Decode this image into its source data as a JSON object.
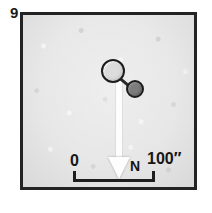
{
  "figure": {
    "panel_number": "9",
    "type": "astronomical-finder-chart",
    "frame": {
      "border_color": "#232323",
      "background_color": "#e7e7e7"
    },
    "sources": [
      {
        "id": "primary",
        "name": "primary-source",
        "shape": "circle",
        "fill": "#dcdcdc",
        "outline": "#1d1d1d",
        "relative_size": "large"
      },
      {
        "id": "secondary",
        "name": "secondary-source",
        "shape": "circle",
        "fill": "#7d7d7d",
        "outline": "#1d1d1d",
        "relative_size": "small"
      }
    ],
    "north_arrow": {
      "label": "N",
      "direction": "down",
      "color": "#fdfdfd"
    },
    "scale_bar": {
      "start_label": "0",
      "end_label": "100″",
      "color": "#1e1e1e"
    }
  }
}
